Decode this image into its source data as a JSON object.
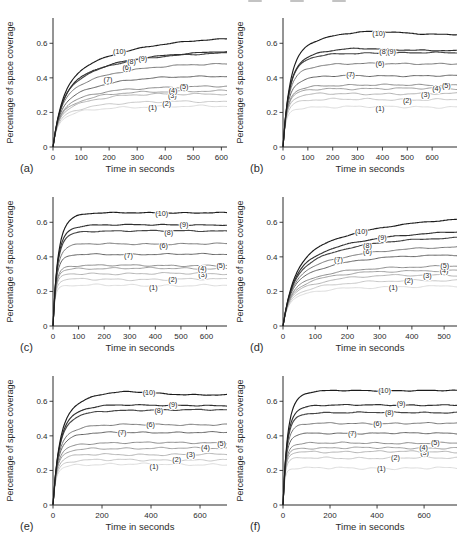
{
  "page": {
    "header_fragment_present": true
  },
  "chart_defaults": {
    "xlabel": "Time in seconds",
    "ylabel": "Percentage of space coverage",
    "yticks": [
      0,
      0.2,
      0.4,
      0.6
    ],
    "ylim": [
      0,
      0.7
    ],
    "axis_color": "#2b2b2b",
    "tick_label_color": "#2b2b2b",
    "curve_label_color": "#2a2a2a",
    "curve_color_dark": "#1c1c1c",
    "curve_color_light": "#d9d9d9",
    "background": "#ffffff",
    "grid": "off",
    "legend": "none (inline curve labels)"
  },
  "rise_profiles": {
    "slow": {
      "tau1": 35,
      "tau2": 230,
      "mix": 0.55
    },
    "medium": {
      "tau1": 26,
      "tau2": 85,
      "mix": 0.72
    },
    "fast": {
      "tau1": 17,
      "tau2": 40,
      "mix": 0.72
    }
  },
  "chart_data": [
    {
      "panel_label": "(a)",
      "type": "line",
      "rise": "slow",
      "xlabel": "Time in seconds",
      "ylabel": "Percentage of space coverage",
      "xlim": [
        0,
        620
      ],
      "xticks": [
        0,
        100,
        200,
        300,
        400,
        500,
        600
      ],
      "series": [
        {
          "label": "(1)",
          "final": 0.235,
          "label_xy": [
            355,
            0.228
          ]
        },
        {
          "label": "(2)",
          "final": 0.262,
          "label_xy": [
            405,
            0.25
          ]
        },
        {
          "label": "(3)",
          "final": 0.308,
          "label_xy": [
            425,
            0.3
          ]
        },
        {
          "label": "(4)",
          "final": 0.325,
          "label_xy": [
            428,
            0.327
          ]
        },
        {
          "label": "(5)",
          "final": 0.35,
          "label_xy": [
            467,
            0.35
          ]
        },
        {
          "label": "(6)",
          "final": 0.48,
          "label_xy": [
            263,
            0.462
          ]
        },
        {
          "label": "(7)",
          "final": 0.41,
          "label_xy": [
            196,
            0.388
          ]
        },
        {
          "label": "(8)",
          "final": 0.545,
          "label_xy": [
            280,
            0.497
          ]
        },
        {
          "label": "(9)",
          "final": 0.552,
          "label_xy": [
            320,
            0.51
          ]
        },
        {
          "label": "(10)",
          "final": 0.625,
          "label_xy": [
            237,
            0.553
          ]
        }
      ]
    },
    {
      "panel_label": "(b)",
      "type": "line",
      "rise": "medium",
      "xlabel": "Time in seconds",
      "ylabel": "Percentage of space coverage",
      "xlim": [
        0,
        700
      ],
      "xticks": [
        0,
        100,
        200,
        300,
        400,
        500,
        600
      ],
      "series": [
        {
          "label": "(1)",
          "final": 0.232,
          "label_xy": [
            390,
            0.222
          ]
        },
        {
          "label": "(2)",
          "final": 0.275,
          "label_xy": [
            500,
            0.268
          ]
        },
        {
          "label": "(3)",
          "final": 0.308,
          "label_xy": [
            573,
            0.303
          ]
        },
        {
          "label": "(4)",
          "final": 0.338,
          "label_xy": [
            618,
            0.336
          ]
        },
        {
          "label": "(5)",
          "final": 0.358,
          "label_xy": [
            657,
            0.358
          ]
        },
        {
          "label": "(6)",
          "final": 0.482,
          "label_xy": [
            390,
            0.483
          ]
        },
        {
          "label": "(7)",
          "final": 0.412,
          "label_xy": [
            272,
            0.418
          ]
        },
        {
          "label": "(8)",
          "final": 0.545,
          "label_xy": [
            405,
            0.552
          ]
        },
        {
          "label": "(9)",
          "final": 0.558,
          "peak": [
            0.4,
            0.015
          ],
          "label_xy": [
            437,
            0.555
          ]
        },
        {
          "label": "(10)",
          "final": 0.652,
          "peak": [
            0.5,
            0.018
          ],
          "label_xy": [
            385,
            0.655
          ]
        }
      ]
    },
    {
      "panel_label": "(c)",
      "type": "line",
      "rise": "fast",
      "xlabel": "Time in seconds",
      "ylabel": "Percentage of space coverage",
      "xlim": [
        0,
        680
      ],
      "xticks": [
        0,
        100,
        200,
        300,
        400,
        500,
        600
      ],
      "series": [
        {
          "label": "(1)",
          "final": 0.235,
          "label_xy": [
            392,
            0.222
          ]
        },
        {
          "label": "(2)",
          "final": 0.27,
          "label_xy": [
            468,
            0.27
          ]
        },
        {
          "label": "(3)",
          "final": 0.303,
          "label_xy": [
            585,
            0.3
          ]
        },
        {
          "label": "(4)",
          "final": 0.333,
          "label_xy": [
            583,
            0.332
          ]
        },
        {
          "label": "(5)",
          "final": 0.35,
          "label_xy": [
            656,
            0.35
          ]
        },
        {
          "label": "(6)",
          "final": 0.475,
          "label_xy": [
            432,
            0.468
          ]
        },
        {
          "label": "(7)",
          "final": 0.415,
          "label_xy": [
            295,
            0.408
          ]
        },
        {
          "label": "(8)",
          "final": 0.55,
          "label_xy": [
            452,
            0.543
          ]
        },
        {
          "label": "(9)",
          "final": 0.585,
          "label_xy": [
            512,
            0.587
          ]
        },
        {
          "label": "(10)",
          "final": 0.655,
          "label_xy": [
            425,
            0.65
          ]
        }
      ]
    },
    {
      "panel_label": "(d)",
      "type": "line",
      "rise": "slow",
      "xlabel": "Time in seconds",
      "ylabel": "Percentage of space coverage",
      "xlim": [
        0,
        540
      ],
      "xticks": [
        0,
        100,
        200,
        300,
        400,
        500
      ],
      "series": [
        {
          "label": "(1)",
          "final": 0.228,
          "label_xy": [
            342,
            0.222
          ]
        },
        {
          "label": "(2)",
          "final": 0.262,
          "label_xy": [
            390,
            0.262
          ]
        },
        {
          "label": "(3)",
          "final": 0.295,
          "label_xy": [
            448,
            0.293
          ]
        },
        {
          "label": "(4)",
          "final": 0.322,
          "label_xy": [
            500,
            0.322
          ]
        },
        {
          "label": "(5)",
          "final": 0.346,
          "label_xy": [
            502,
            0.35
          ]
        },
        {
          "label": "(6)",
          "final": 0.455,
          "label_xy": [
            262,
            0.432
          ]
        },
        {
          "label": "(7)",
          "final": 0.41,
          "label_xy": [
            172,
            0.385
          ]
        },
        {
          "label": "(8)",
          "final": 0.512,
          "label_xy": [
            262,
            0.463
          ]
        },
        {
          "label": "(9)",
          "final": 0.545,
          "label_xy": [
            308,
            0.512
          ]
        },
        {
          "label": "(10)",
          "final": 0.615,
          "label_xy": [
            243,
            0.545
          ]
        }
      ]
    },
    {
      "panel_label": "(e)",
      "type": "line",
      "rise": "medium",
      "xlabel": "Time in seconds",
      "ylabel": "Percentage of space coverage",
      "xlim": [
        0,
        710
      ],
      "xticks": [
        0,
        200,
        400,
        600
      ],
      "series": [
        {
          "label": "(1)",
          "final": 0.235,
          "label_xy": [
            412,
            0.222
          ]
        },
        {
          "label": "(2)",
          "final": 0.26,
          "label_xy": [
            505,
            0.262
          ]
        },
        {
          "label": "(3)",
          "final": 0.292,
          "label_xy": [
            562,
            0.295
          ]
        },
        {
          "label": "(4)",
          "final": 0.328,
          "label_xy": [
            622,
            0.332
          ]
        },
        {
          "label": "(5)",
          "final": 0.36,
          "label_xy": [
            688,
            0.358
          ]
        },
        {
          "label": "(6)",
          "final": 0.465,
          "label_xy": [
            398,
            0.468
          ]
        },
        {
          "label": "(7)",
          "final": 0.42,
          "label_xy": [
            282,
            0.418
          ]
        },
        {
          "label": "(8)",
          "final": 0.55,
          "label_xy": [
            432,
            0.548
          ]
        },
        {
          "label": "(9)",
          "final": 0.575,
          "peak": [
            0.3,
            0.01
          ],
          "label_xy": [
            490,
            0.583
          ]
        },
        {
          "label": "(10)",
          "final": 0.638,
          "peak": [
            0.38,
            0.022
          ],
          "label_xy": [
            392,
            0.648
          ]
        }
      ]
    },
    {
      "panel_label": "(f)",
      "type": "line",
      "rise": "fast",
      "xlabel": "Time in seconds",
      "ylabel": "Percentage of space coverage",
      "xlim": [
        0,
        740
      ],
      "xticks": [
        0,
        200,
        400,
        600
      ],
      "series": [
        {
          "label": "(1)",
          "final": 0.213,
          "label_xy": [
            418,
            0.212
          ]
        },
        {
          "label": "(2)",
          "final": 0.272,
          "label_xy": [
            478,
            0.272
          ]
        },
        {
          "label": "(3)",
          "final": 0.308,
          "label_xy": [
            602,
            0.305
          ]
        },
        {
          "label": "(4)",
          "final": 0.33,
          "label_xy": [
            598,
            0.335
          ]
        },
        {
          "label": "(5)",
          "final": 0.358,
          "label_xy": [
            648,
            0.36
          ]
        },
        {
          "label": "(6)",
          "final": 0.472,
          "label_xy": [
            402,
            0.472
          ]
        },
        {
          "label": "(7)",
          "final": 0.415,
          "label_xy": [
            295,
            0.415
          ]
        },
        {
          "label": "(8)",
          "final": 0.535,
          "label_xy": [
            452,
            0.538
          ]
        },
        {
          "label": "(9)",
          "final": 0.578,
          "label_xy": [
            502,
            0.588
          ]
        },
        {
          "label": "(10)",
          "final": 0.662,
          "label_xy": [
            432,
            0.66
          ]
        }
      ]
    }
  ]
}
